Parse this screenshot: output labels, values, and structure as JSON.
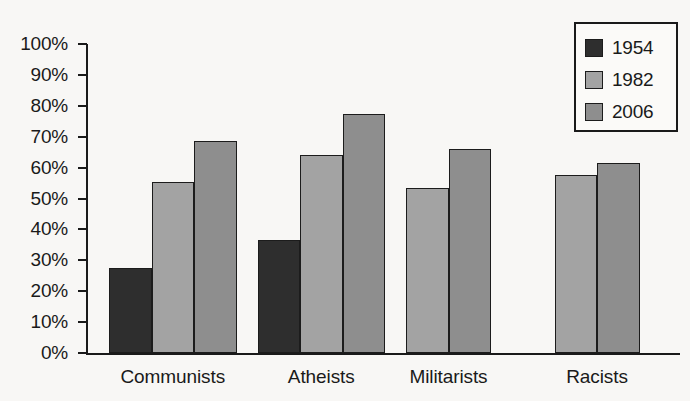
{
  "chart_data": {
    "type": "bar",
    "title": "",
    "subtitle": "",
    "xlabel": "",
    "ylabel": "",
    "categories": [
      "Communists",
      "Atheists",
      "Militarists",
      "Racists"
    ],
    "series": [
      {
        "name": "1954",
        "color": "#2e2e2e",
        "values": [
          27.5,
          36.5,
          null,
          null
        ]
      },
      {
        "name": "1982",
        "color": "#a3a3a3",
        "values": [
          55.5,
          64.0,
          53.5,
          57.5
        ]
      },
      {
        "name": "2006",
        "color": "#8e8e8e",
        "values": [
          68.5,
          77.5,
          66.0,
          61.5
        ]
      }
    ],
    "ylim": [
      0,
      100
    ],
    "y_tick_values": [
      0,
      10,
      20,
      30,
      40,
      50,
      60,
      70,
      80,
      90,
      100
    ],
    "y_tick_labels": [
      "0%",
      "10%",
      "20%",
      "30%",
      "40%",
      "50%",
      "60%",
      "70%",
      "80%",
      "90%",
      "100%"
    ],
    "grid": false,
    "legend_position": "top-right",
    "legend_entries": [
      "1954",
      "1982",
      "2006"
    ]
  },
  "axes": {
    "y_axis_name": "y-axis",
    "x_axis_name": "x-axis"
  },
  "colors": {
    "background": "#f8f7f5",
    "axis": "#1a1a1a",
    "series_1954": "#2e2e2e",
    "series_1982": "#a3a3a3",
    "series_2006": "#8e8e8e"
  }
}
